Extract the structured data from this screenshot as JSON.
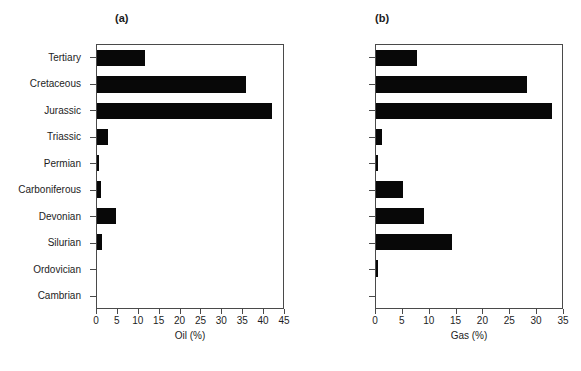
{
  "figure": {
    "panel_a_label": "(a)",
    "panel_b_label": "(b)",
    "caption": ""
  },
  "chart_data": [
    {
      "type": "bar",
      "orientation": "horizontal",
      "panel": "(a)",
      "title": "",
      "xlabel": "Oil (%)",
      "ylabel": "",
      "xlim": [
        0,
        45
      ],
      "xticks": [
        0,
        5,
        10,
        15,
        20,
        25,
        30,
        35,
        40,
        45
      ],
      "xticklabels": [
        "0",
        "5",
        "10",
        "15",
        "20",
        "25",
        "30",
        "35",
        "40",
        "45"
      ],
      "grid": false,
      "legend": false,
      "bar_color": "#080808",
      "categories": [
        "Tertiary",
        "Cretaceous",
        "Jurassic",
        "Triassic",
        "Permian",
        "Carboniferous",
        "Devonian",
        "Silurian",
        "Ordovician",
        "Cambrian"
      ],
      "values": [
        11.5,
        36.0,
        42.3,
        2.7,
        0.4,
        1.0,
        4.5,
        1.2,
        0.0,
        0.0
      ]
    },
    {
      "type": "bar",
      "orientation": "horizontal",
      "panel": "(b)",
      "title": "",
      "xlabel": "Gas (%)",
      "ylabel": "",
      "xlim": [
        0,
        35
      ],
      "xticks": [
        0,
        5,
        10,
        15,
        20,
        25,
        30,
        35
      ],
      "xticklabels": [
        "0",
        "5",
        "10",
        "15",
        "20",
        "25",
        "30",
        "35"
      ],
      "grid": false,
      "legend": false,
      "bar_color": "#080808",
      "categories": [
        "Tertiary",
        "Cretaceous",
        "Jurassic",
        "Triassic",
        "Permian",
        "Carboniferous",
        "Devonian",
        "Silurian",
        "Ordovician",
        "Cambrian"
      ],
      "values": [
        7.8,
        28.4,
        33.1,
        1.1,
        0.3,
        5.0,
        9.0,
        14.3,
        0.3,
        0.0
      ]
    }
  ]
}
